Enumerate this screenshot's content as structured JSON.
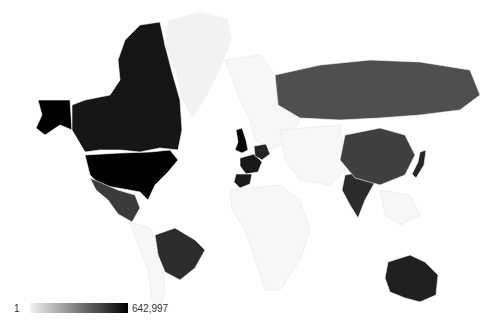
{
  "chart_data": {
    "type": "geo-choropleth",
    "title": "",
    "color_scale": {
      "min_value": 1,
      "max_value": 642997,
      "min_color": "#f2f2f2",
      "max_color": "#000000",
      "no_data_color": "#f7f7f7"
    },
    "legend": {
      "min_label": "1",
      "max_label": "642,997",
      "position": "bottom-left"
    },
    "regions": [
      {
        "name": "United States",
        "value": 642997
      },
      {
        "name": "United Kingdom",
        "value": 480000
      },
      {
        "name": "Canada",
        "value": 190000
      },
      {
        "name": "France",
        "value": 160000
      },
      {
        "name": "Spain",
        "value": 150000
      },
      {
        "name": "Germany",
        "value": 90000
      },
      {
        "name": "Australia",
        "value": 110000
      },
      {
        "name": "Brazil",
        "value": 55000
      },
      {
        "name": "India",
        "value": 60000
      },
      {
        "name": "Japan",
        "value": 80000
      },
      {
        "name": "Mexico",
        "value": 25000
      },
      {
        "name": "China",
        "value": 20000
      },
      {
        "name": "Russia",
        "value": 8000
      },
      {
        "name": "Greenland",
        "value": 1
      }
    ]
  }
}
